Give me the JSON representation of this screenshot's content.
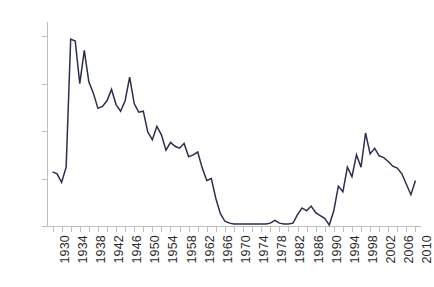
{
  "chart_data": {
    "type": "line",
    "title": "",
    "subtitle": "",
    "xlabel": "",
    "ylabel": "",
    "xlim": [
      1929,
      2011
    ],
    "ylim": [
      0,
      215
    ],
    "yticks": [
      0,
      50,
      100,
      150,
      200
    ],
    "xticks": [
      1930,
      1932,
      1934,
      1936,
      1938,
      1940,
      1942,
      1944,
      1946,
      1948,
      1950,
      1952,
      1954,
      1956,
      1958,
      1960,
      1962,
      1964,
      1966,
      1968,
      1970,
      1972,
      1974,
      1976,
      1978,
      1980,
      1982,
      1984,
      1986,
      1988,
      1990,
      1992,
      1994,
      1996,
      1998,
      2000,
      2002,
      2004,
      2006,
      2008,
      2010
    ],
    "xtick_labels": [
      "1930",
      "1934",
      "1938",
      "1942",
      "1946",
      "1950",
      "1954",
      "1958",
      "1962",
      "1966",
      "1970",
      "1974",
      "1978",
      "1982",
      "1986",
      "1990",
      "1994",
      "1998",
      "2002",
      "2006",
      "2010"
    ],
    "xtick_label_years": [
      1930,
      1934,
      1938,
      1942,
      1946,
      1950,
      1954,
      1958,
      1962,
      1966,
      1970,
      1974,
      1978,
      1982,
      1986,
      1990,
      1994,
      1998,
      2002,
      2006,
      2010
    ],
    "grid": false,
    "legend": false,
    "line_color": "#2b2f4a",
    "axis_color": "#bfbfbf",
    "text_color": "#2b2b2b",
    "x": [
      1930,
      1931,
      1932,
      1933,
      1934,
      1935,
      1936,
      1937,
      1938,
      1939,
      1940,
      1941,
      1942,
      1943,
      1944,
      1945,
      1946,
      1947,
      1948,
      1949,
      1950,
      1951,
      1952,
      1953,
      1954,
      1955,
      1956,
      1957,
      1958,
      1959,
      1960,
      1961,
      1962,
      1963,
      1964,
      1965,
      1966,
      1967,
      1968,
      1969,
      1970,
      1971,
      1972,
      1973,
      1974,
      1975,
      1976,
      1977,
      1978,
      1979,
      1980,
      1981,
      1982,
      1983,
      1984,
      1985,
      1986,
      1987,
      1988,
      1989,
      1990,
      1991,
      1992,
      1993,
      1994,
      1995,
      1996,
      1997,
      1998,
      1999,
      2000,
      2001,
      2002,
      2003,
      2004,
      2005,
      2006,
      2007,
      2008,
      2009,
      2010
    ],
    "y": [
      57,
      55,
      46,
      62,
      197,
      195,
      150,
      185,
      152,
      140,
      124,
      126,
      132,
      144,
      128,
      121,
      132,
      157,
      129,
      120,
      121,
      99,
      91,
      105,
      96,
      80,
      88,
      84,
      82,
      87,
      73,
      75,
      78,
      61,
      48,
      50,
      29,
      13,
      5,
      3,
      2,
      2,
      2,
      2,
      2,
      2,
      2,
      2,
      3,
      6,
      3,
      2,
      2,
      3,
      12,
      19,
      16,
      21,
      14,
      11,
      8,
      1,
      16,
      42,
      36,
      62,
      52,
      75,
      62,
      98,
      76,
      82,
      74,
      72,
      68,
      63,
      61,
      55,
      44,
      33,
      48
    ],
    "series_name": "value"
  },
  "axis": {
    "y_labels": [
      "200",
      "150",
      "100",
      "50",
      "0"
    ]
  }
}
